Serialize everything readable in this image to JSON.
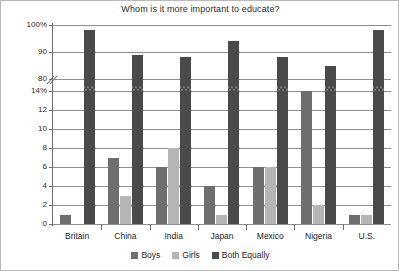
{
  "chart_data": {
    "type": "bar",
    "title": "Whom is it more important to educate?",
    "xlabel": "",
    "ylabel": "",
    "categories": [
      "Britain",
      "China",
      "India",
      "Japan",
      "Mexico",
      "Nigeria",
      "U.S."
    ],
    "series": [
      {
        "name": "Boys",
        "color": "#6e6e6e",
        "values": [
          1,
          7,
          6,
          4,
          6,
          14,
          1
        ]
      },
      {
        "name": "Girls",
        "color": "#b5b5b5",
        "values": [
          0,
          3,
          8,
          1,
          6,
          2,
          1
        ]
      },
      {
        "name": "Both Equally",
        "color": "#4a4a4a",
        "values": [
          98,
          89,
          88,
          94,
          88,
          85,
          98
        ]
      }
    ],
    "axis_break": true,
    "lower_axis": {
      "min": 0,
      "max": 14,
      "ticks": [
        "0",
        "2",
        "4",
        "6",
        "8",
        "10",
        "12",
        "14%"
      ]
    },
    "upper_axis": {
      "min": 80,
      "max": 100,
      "ticks": [
        "80",
        "90",
        "100%"
      ]
    },
    "y_tick_labels": [
      "100%",
      "90",
      "80",
      "14%",
      "12",
      "10",
      "8",
      "6",
      "4",
      "2",
      "0"
    ],
    "grid": true,
    "legend_position": "bottom",
    "legend": [
      "Boys",
      "Girls",
      "Both Equally"
    ]
  }
}
